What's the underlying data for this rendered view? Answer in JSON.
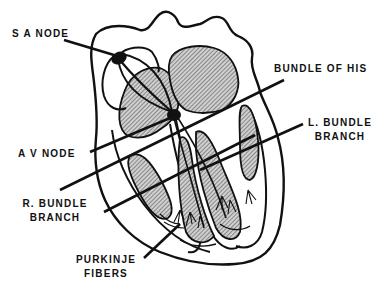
{
  "diagram": {
    "colors": {
      "stroke": "#111111",
      "hatch_fill": "#b8b8b8",
      "background": "#ffffff",
      "node_fill": "#111111"
    },
    "labels": {
      "sa_node": "S A   NODE",
      "bundle_of_his": "BUNDLE  OF  HIS",
      "av_node": "A V   NODE",
      "l_bundle_line1": "L. BUNDLE",
      "l_bundle_line2": "BRANCH",
      "r_bundle_line1": "R.  BUNDLE",
      "r_bundle_line2": "BRANCH",
      "purkinje_line1": "PURKINJE",
      "purkinje_line2": "FIBERS"
    }
  }
}
